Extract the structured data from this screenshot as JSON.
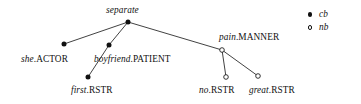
{
  "diagram": {
    "type": "dependency-tree",
    "title": "separate",
    "nodes": [
      {
        "id": "separate",
        "lemma": "separate",
        "func": "",
        "label": "separate",
        "node_type": "cb",
        "marker": "filled-dot",
        "x": 128,
        "y": 22,
        "label_x": 106,
        "label_y": 6,
        "label_align": "center"
      },
      {
        "id": "she-actor",
        "lemma": "she",
        "func": ".ACTOR",
        "label": "she.ACTOR",
        "node_type": "cb",
        "marker": "filled-dot",
        "x": 64,
        "y": 44,
        "label_x": 21,
        "label_y": 55,
        "label_align": "center"
      },
      {
        "id": "boyfriend-patient",
        "lemma": "boyfriend",
        "func": ".PATIENT",
        "label": "boyfriend.PATIENT",
        "node_type": "cb",
        "marker": "filled-dot",
        "x": 109,
        "y": 45,
        "label_x": 94,
        "label_y": 55,
        "label_align": "center"
      },
      {
        "id": "pain-manner",
        "lemma": "pain",
        "func": ".MANNER",
        "label": "pain.MANNER",
        "node_type": "nb",
        "marker": "hollow-dot",
        "x": 222,
        "y": 50,
        "label_x": 219,
        "label_y": 33,
        "label_align": "center"
      },
      {
        "id": "first-rstr",
        "lemma": "first",
        "func": ".RSTR",
        "label": "first.RSTR",
        "node_type": "cb",
        "marker": "filled-dot",
        "x": 88,
        "y": 77,
        "label_x": 71,
        "label_y": 86,
        "label_align": "center"
      },
      {
        "id": "no-rstr",
        "lemma": "no",
        "func": ".RSTR",
        "label": "no.RSTR",
        "node_type": "nb",
        "marker": "hollow-dot",
        "x": 226,
        "y": 77,
        "label_x": 199,
        "label_y": 86,
        "label_align": "center"
      },
      {
        "id": "great-rstr",
        "lemma": "great",
        "func": ".RSTR",
        "label": "great.RSTR",
        "node_type": "nb",
        "marker": "hollow-dot",
        "x": 258,
        "y": 76,
        "label_x": 249,
        "label_y": 86,
        "label_align": "center"
      }
    ],
    "edges": [
      {
        "id": "edge-separate-she",
        "from": "separate",
        "to": "she-actor"
      },
      {
        "id": "edge-separate-boyfriend",
        "from": "separate",
        "to": "boyfriend-patient"
      },
      {
        "id": "edge-separate-pain",
        "from": "separate",
        "to": "pain-manner"
      },
      {
        "id": "edge-boyfriend-first",
        "from": "boyfriend-patient",
        "to": "first-rstr"
      },
      {
        "id": "edge-pain-no",
        "from": "pain-manner",
        "to": "no-rstr"
      },
      {
        "id": "edge-pain-great",
        "from": "pain-manner",
        "to": "great-rstr"
      }
    ]
  },
  "legend": {
    "items": [
      {
        "marker": "filled-dot",
        "label": "cb"
      },
      {
        "marker": "hollow-dot",
        "label": "nb"
      }
    ]
  },
  "colors": {
    "ink": "#111111",
    "background": "#ffffff"
  }
}
